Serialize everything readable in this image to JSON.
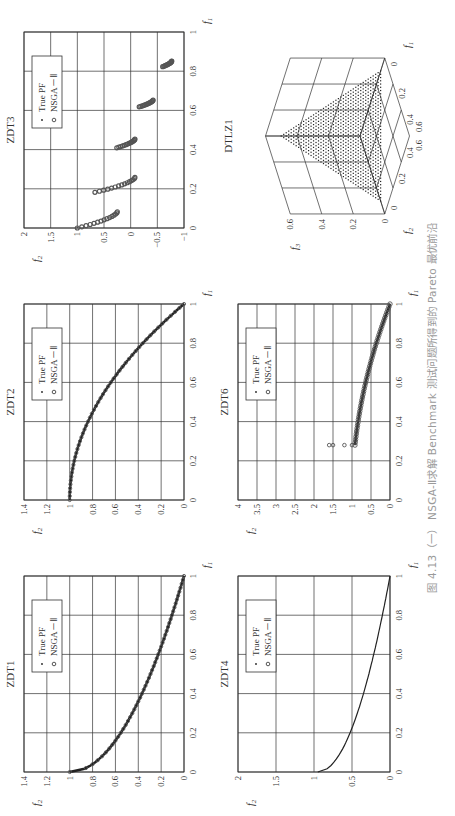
{
  "caption": "图 4.13（一）  NSGA-Ⅱ求解 Benchmark 测试问题所得到的 Pareto 最优前沿",
  "legend": {
    "true_pf": "True PF",
    "nsga": "NSGA－Ⅱ"
  },
  "colors": {
    "grid": "#333333",
    "points": "#555555",
    "curve": "#222222",
    "caption": "#9a9a9a"
  },
  "chart_data": [
    {
      "id": "zdt1",
      "type": "scatter",
      "title": "ZDT1",
      "xlabel": "f1",
      "ylabel": "f2",
      "xlim": [
        0,
        1
      ],
      "ylim": [
        0,
        1.4
      ],
      "xticks": [
        "0",
        "0.2",
        "0.4",
        "0.6",
        "0.8",
        "1"
      ],
      "yticks": [
        "0",
        "0.2",
        "0.4",
        "0.6",
        "0.8",
        "1",
        "1.2",
        "1.4"
      ],
      "legend": [
        "True PF",
        "NSGA－Ⅱ"
      ],
      "legend_position": "upper right",
      "grid": true,
      "series": [
        {
          "name": "True PF",
          "formula": "f2 = 1 - sqrt(f1)",
          "x": [
            0,
            0.05,
            0.1,
            0.2,
            0.3,
            0.4,
            0.5,
            0.6,
            0.7,
            0.8,
            0.9,
            1.0
          ],
          "y": [
            1.0,
            0.78,
            0.68,
            0.55,
            0.45,
            0.37,
            0.29,
            0.23,
            0.16,
            0.11,
            0.05,
            0.0
          ]
        },
        {
          "name": "NSGA－Ⅱ",
          "x": [
            0,
            0.05,
            0.1,
            0.2,
            0.3,
            0.4,
            0.5,
            0.6,
            0.7,
            0.8,
            0.9,
            1.0
          ],
          "y": [
            1.0,
            0.78,
            0.68,
            0.55,
            0.45,
            0.37,
            0.29,
            0.23,
            0.16,
            0.11,
            0.05,
            0.0
          ]
        }
      ]
    },
    {
      "id": "zdt2",
      "type": "scatter",
      "title": "ZDT2",
      "xlabel": "f1",
      "ylabel": "f2",
      "xlim": [
        0,
        1
      ],
      "ylim": [
        0,
        1.4
      ],
      "xticks": [
        "0",
        "0.2",
        "0.4",
        "0.6",
        "0.8",
        "1"
      ],
      "yticks": [
        "0",
        "0.2",
        "0.4",
        "0.6",
        "0.8",
        "1",
        "1.2",
        "1.4"
      ],
      "legend": [
        "True PF",
        "NSGA－Ⅱ"
      ],
      "legend_position": "upper right",
      "grid": true,
      "series": [
        {
          "name": "True PF",
          "formula": "f2 = 1 - f1^2",
          "x": [
            0,
            0.1,
            0.2,
            0.3,
            0.4,
            0.5,
            0.6,
            0.7,
            0.8,
            0.9,
            1.0
          ],
          "y": [
            1.0,
            0.99,
            0.96,
            0.91,
            0.84,
            0.75,
            0.64,
            0.51,
            0.36,
            0.19,
            0.0
          ]
        },
        {
          "name": "NSGA－Ⅱ",
          "x": [
            0,
            0.1,
            0.2,
            0.3,
            0.4,
            0.5,
            0.6,
            0.7,
            0.8,
            0.9,
            1.0
          ],
          "y": [
            1.0,
            0.99,
            0.96,
            0.91,
            0.84,
            0.75,
            0.64,
            0.51,
            0.36,
            0.19,
            0.0
          ]
        }
      ]
    },
    {
      "id": "zdt3",
      "type": "scatter",
      "title": "ZDT3",
      "xlabel": "f1",
      "ylabel": "f2",
      "xlim": [
        0,
        1
      ],
      "ylim": [
        -1,
        2
      ],
      "xticks": [
        "0",
        "0.2",
        "0.4",
        "0.6",
        "0.8",
        "1"
      ],
      "yticks": [
        "−1",
        "−0.5",
        "0",
        "0.5",
        "1",
        "1.5",
        "2"
      ],
      "legend": [
        "True PF",
        "NSGA－Ⅱ"
      ],
      "legend_position": "upper right",
      "grid": true,
      "series": [
        {
          "name": "True PF / NSGA－Ⅱ segments",
          "segments": [
            {
              "x": [
                0.0,
                0.083
              ],
              "y": [
                1.0,
                0.25
              ]
            },
            {
              "x": [
                0.182,
                0.258
              ],
              "y": [
                0.67,
                -0.08
              ]
            },
            {
              "x": [
                0.409,
                0.454
              ],
              "y": [
                0.26,
                -0.08
              ]
            },
            {
              "x": [
                0.618,
                0.653
              ],
              "y": [
                -0.16,
                -0.42
              ]
            },
            {
              "x": [
                0.823,
                0.852
              ],
              "y": [
                -0.6,
                -0.77
              ]
            }
          ]
        }
      ]
    },
    {
      "id": "zdt4",
      "type": "scatter",
      "title": "ZDT4",
      "xlabel": "f1",
      "ylabel": "f2",
      "xlim": [
        0,
        1
      ],
      "ylim": [
        0,
        2
      ],
      "xticks": [
        "0",
        "0.2",
        "0.4",
        "0.6",
        "0.8",
        "1"
      ],
      "yticks": [
        "0",
        "0.5",
        "1",
        "1.5",
        "2"
      ],
      "legend": [
        "True PF",
        "NSGA－Ⅱ"
      ],
      "legend_position": "upper right",
      "grid": true,
      "series": [
        {
          "name": "True PF",
          "formula": "f2 = 1 - sqrt(f1)",
          "x": [
            0,
            0.1,
            0.2,
            0.4,
            0.6,
            0.8,
            1.0
          ],
          "y": [
            0.95,
            0.68,
            0.55,
            0.37,
            0.23,
            0.11,
            0.0
          ]
        },
        {
          "name": "NSGA－Ⅱ",
          "x": [
            0,
            0.1,
            0.2,
            0.4,
            0.6,
            0.8,
            1.0
          ],
          "y": [
            0.95,
            0.68,
            0.55,
            0.37,
            0.23,
            0.11,
            0.0
          ]
        }
      ]
    },
    {
      "id": "zdt6",
      "type": "scatter",
      "title": "ZDT6",
      "xlabel": "f1",
      "ylabel": "f2",
      "xlim": [
        0,
        1
      ],
      "ylim": [
        0,
        4
      ],
      "xticks": [
        "0",
        "0.2",
        "0.4",
        "0.6",
        "0.8",
        "1"
      ],
      "yticks": [
        "0",
        "0.5",
        "1",
        "1.5",
        "2",
        "2.5",
        "3",
        "3.5",
        "4"
      ],
      "legend": [
        "True PF",
        "NSGA－Ⅱ"
      ],
      "legend_position": "upper right",
      "grid": true,
      "series": [
        {
          "name": "True PF",
          "formula": "f2 = 1 - f1^2",
          "x": [
            0.28,
            0.4,
            0.5,
            0.6,
            0.7,
            0.8,
            0.9,
            1.0
          ],
          "y": [
            0.92,
            0.84,
            0.75,
            0.64,
            0.51,
            0.36,
            0.19,
            0.0
          ]
        },
        {
          "name": "NSGA－Ⅱ",
          "x": [
            0.28,
            0.28,
            0.28,
            0.28,
            0.4,
            0.5,
            0.6,
            0.7,
            0.8,
            0.9,
            1.0
          ],
          "y": [
            1.6,
            1.5,
            1.2,
            1.0,
            0.84,
            0.75,
            0.64,
            0.51,
            0.36,
            0.19,
            0.0
          ]
        }
      ]
    },
    {
      "id": "dtlz1",
      "type": "scatter3d",
      "title": "DTLZ1",
      "xlabel": "f1",
      "ylabel": "f2",
      "zlabel": "f3",
      "xlim": [
        0,
        0.6
      ],
      "ylim": [
        0,
        0.6
      ],
      "zlim": [
        0,
        0.6
      ],
      "xticks": [
        "0",
        "0.2",
        "0.4",
        "0.6"
      ],
      "yticks": [
        "0",
        "0.2",
        "0.4",
        "0.6"
      ],
      "zticks": [
        "0",
        "0.2",
        "0.4",
        "0.6"
      ],
      "grid": true,
      "series": [
        {
          "name": "Pareto front",
          "surface": "f1 + f2 + f3 = 0.5"
        }
      ]
    }
  ]
}
